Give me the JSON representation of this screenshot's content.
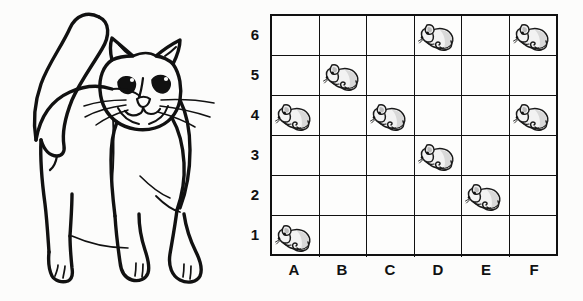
{
  "scene": {
    "title": "Cat and mice coordinate grid",
    "background_color": "#fcfcfb",
    "ink_color": "#111111"
  },
  "illustration": {
    "subject": "cat",
    "name": "cat-line-drawing",
    "style": "black-and-white line art",
    "description": "Standing cat facing forward with raised curved tail and whiskers"
  },
  "grid": {
    "columns": [
      "A",
      "B",
      "C",
      "D",
      "E",
      "F"
    ],
    "rows": [
      "6",
      "5",
      "4",
      "3",
      "2",
      "1"
    ],
    "row_count": 6,
    "column_count": 6,
    "border_color": "#111111",
    "cell_fill": "#fdfdfc",
    "token_icon": "mouse-icon",
    "tokens": [
      "D6",
      "F6",
      "B5",
      "A4",
      "C4",
      "F4",
      "D3",
      "E2",
      "A1"
    ],
    "occupancy": [
      [
        false,
        false,
        false,
        true,
        false,
        true
      ],
      [
        false,
        true,
        false,
        false,
        false,
        false
      ],
      [
        true,
        false,
        true,
        false,
        false,
        true
      ],
      [
        false,
        false,
        false,
        true,
        false,
        false
      ],
      [
        false,
        false,
        false,
        false,
        true,
        false
      ],
      [
        true,
        false,
        false,
        false,
        false,
        false
      ]
    ],
    "token_count": 9
  }
}
